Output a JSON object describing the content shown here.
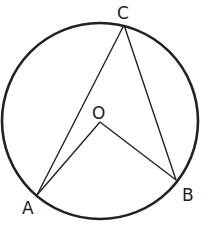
{
  "diagram": {
    "type": "circle-inscribed-angle",
    "circle": {
      "cx": 100,
      "cy": 121,
      "r": 98,
      "stroke": "#222222",
      "stroke_width": 2.6
    },
    "points": {
      "A": {
        "label": "A",
        "x": 37,
        "y": 195
      },
      "B": {
        "label": "B",
        "x": 176,
        "y": 180
      },
      "C": {
        "label": "C",
        "x": 124,
        "y": 25
      },
      "O": {
        "label": "O",
        "x": 100,
        "y": 122
      }
    },
    "segments": [
      [
        "A",
        "C"
      ],
      [
        "C",
        "B"
      ],
      [
        "A",
        "O"
      ],
      [
        "O",
        "B"
      ]
    ],
    "line_color": "#222222"
  }
}
